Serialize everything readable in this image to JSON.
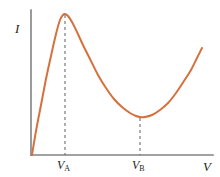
{
  "figure": {
    "width": 220,
    "height": 177,
    "background": "#ffffff"
  },
  "axes": {
    "y_axis_label": "I",
    "x_axis_label": "V",
    "axis_color": "#808285",
    "origin_px": [
      31,
      155
    ],
    "y_axis_top_px": 10,
    "x_axis_right_px": 213
  },
  "ticks": [
    {
      "name": "V-A",
      "var": "V",
      "sub": "A",
      "x_px": 65
    },
    {
      "name": "V-B",
      "var": "V",
      "sub": "B",
      "x_px": 140
    }
  ],
  "guides": {
    "color": "#6d6e71",
    "dash": "3 3",
    "lines": [
      {
        "name": "guide-VA",
        "x_px": 65,
        "y_top_px": 15,
        "y_bottom_px": 155
      },
      {
        "name": "guide-VB",
        "x_px": 140,
        "y_top_px": 118,
        "y_bottom_px": 155
      }
    ]
  },
  "chart_data": {
    "type": "line",
    "title": "",
    "xlabel": "V",
    "ylabel": "I",
    "grid": false,
    "legend": null,
    "curve_color": "#d5713c",
    "curve_width": 2,
    "annotations": [
      {
        "label": "V_A",
        "kind": "peak-marker",
        "x": 65
      },
      {
        "label": "V_B",
        "kind": "valley-marker",
        "x": 140
      }
    ],
    "features": {
      "origin": {
        "x": 32,
        "y": 155
      },
      "peak": {
        "x": 65,
        "y": 14,
        "label": "V_A"
      },
      "minimum": {
        "x": 143,
        "y": 117,
        "label": "V_B"
      },
      "right_end": {
        "x": 202,
        "y": 48
      }
    },
    "x": [
      32,
      36,
      41,
      46,
      51,
      56,
      60,
      63,
      65,
      68,
      72,
      77,
      83,
      90,
      98,
      106,
      114,
      122,
      130,
      136,
      140,
      145,
      152,
      160,
      168,
      176,
      184,
      191,
      197,
      202
    ],
    "y": [
      155,
      131,
      105,
      79,
      56,
      34,
      20,
      15,
      14,
      16,
      22,
      32,
      45,
      59,
      75,
      88,
      99,
      107,
      113,
      116,
      117,
      117,
      115,
      110,
      103,
      93,
      81,
      70,
      58,
      48
    ],
    "xlim": [
      31,
      213
    ],
    "ylim": [
      155,
      10
    ],
    "xtick_labels": [
      "V_A",
      "V_B"
    ],
    "ytick_labels": []
  }
}
